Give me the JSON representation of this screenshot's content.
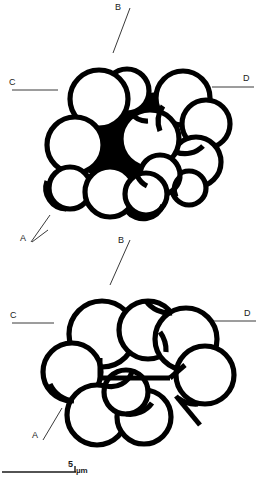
{
  "figure": {
    "background_color": "#ffffff",
    "stroke_color": "#000000",
    "label_color": "#1a1a1a"
  },
  "panels": [
    {
      "id": "upper-panel",
      "name": "upper-section-diagram",
      "description": "Upper cross-section showing cluster of rounded cells with thick outlines and filled interstitial regions",
      "cell_count": 13
    },
    {
      "id": "lower-panel",
      "name": "lower-section-diagram",
      "description": "Lower cross-section showing cluster of rounded cells with an internal linear septum",
      "cell_count": 9
    }
  ],
  "section_labels": {
    "upper": [
      {
        "text": "B",
        "name": "section-label-b-upper",
        "x": 119,
        "y": 5,
        "leader": "diagonal-down-left"
      },
      {
        "text": "C",
        "name": "section-label-c-upper",
        "x": 10,
        "y": 79,
        "leader": "horizontal-right"
      },
      {
        "text": "D",
        "name": "section-label-d-upper",
        "x": 243,
        "y": 74,
        "leader": "horizontal-left"
      },
      {
        "text": "A",
        "name": "section-label-a-upper",
        "x": 21,
        "y": 234,
        "leader": "diagonal-up-right"
      }
    ],
    "lower": [
      {
        "text": "A",
        "name": "section-label-a-mid",
        "x": 22,
        "y": 234,
        "leader": "diagonal-up-right"
      },
      {
        "text": "B",
        "name": "section-label-b-lower",
        "x": 119,
        "y": 238,
        "leader": "diagonal-down-left"
      },
      {
        "text": "C",
        "name": "section-label-c-lower",
        "x": 11,
        "y": 312,
        "leader": "horizontal-right"
      },
      {
        "text": "D",
        "name": "section-label-d-lower",
        "x": 244,
        "y": 310,
        "leader": "horizontal-left"
      },
      {
        "text": "A",
        "name": "section-label-a-lower",
        "x": 33,
        "y": 431,
        "leader": "diagonal-up-right"
      }
    ]
  },
  "scale_bar": {
    "name": "scale-bar",
    "value": "5",
    "unit": "µm",
    "length_px": 88,
    "x": 18,
    "y": 470
  }
}
